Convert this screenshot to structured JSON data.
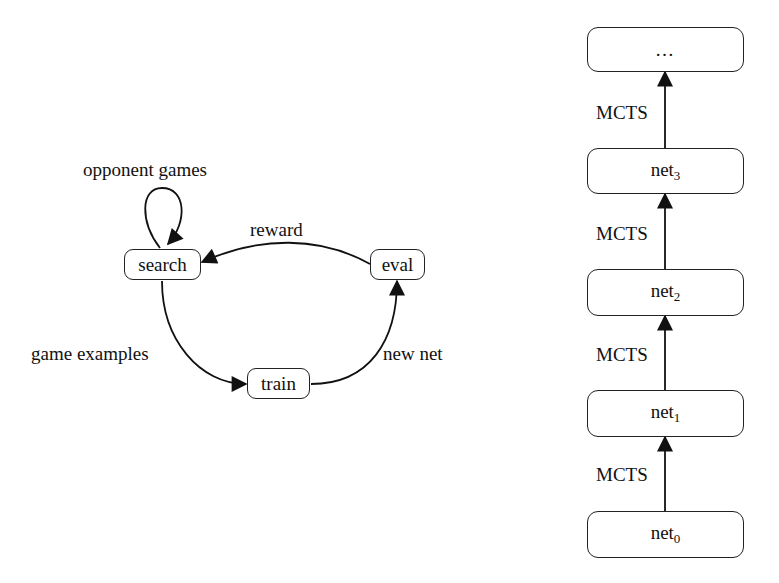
{
  "left_diagram": {
    "nodes": {
      "search": "search",
      "eval": "eval",
      "train": "train"
    },
    "edges": {
      "self_loop": "opponent games",
      "eval_to_search": "reward",
      "search_to_train": "game examples",
      "train_to_eval": "new net"
    }
  },
  "right_diagram": {
    "nodes": [
      {
        "base": "…",
        "sub": ""
      },
      {
        "base": "net",
        "sub": "3"
      },
      {
        "base": "net",
        "sub": "2"
      },
      {
        "base": "net",
        "sub": "1"
      },
      {
        "base": "net",
        "sub": "0"
      }
    ],
    "edge_labels": [
      "MCTS",
      "MCTS",
      "MCTS",
      "MCTS"
    ]
  },
  "colors": {
    "stroke": "#111111",
    "background": "#ffffff"
  }
}
